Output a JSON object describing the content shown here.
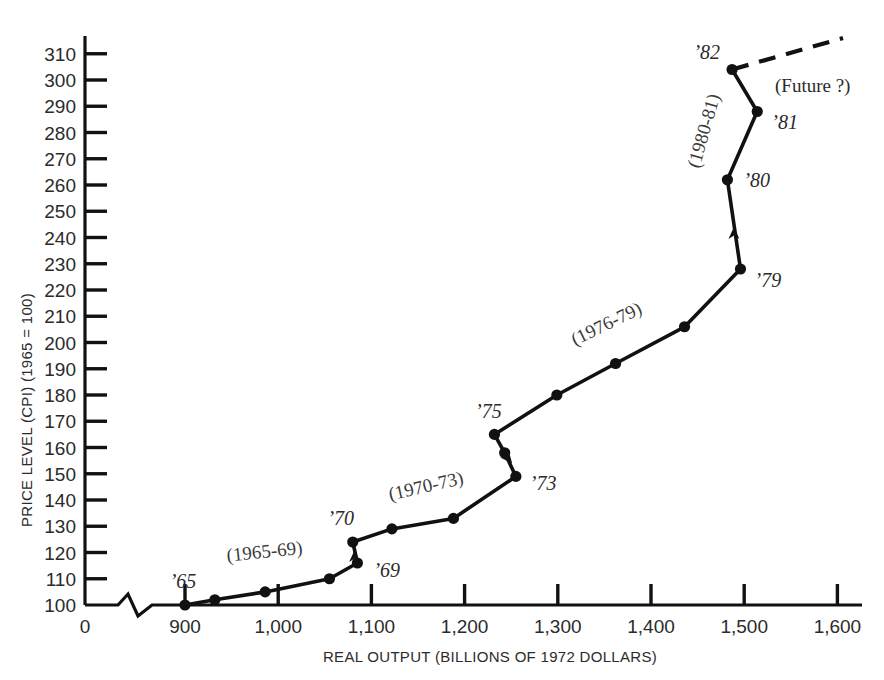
{
  "chart_data": {
    "type": "line",
    "title": "",
    "xlabel": "REAL OUTPUT (BILLIONS OF 1972 DOLLARS)",
    "ylabel": "PRICE LEVEL (CPI) (1965 = 100)",
    "xlim": [
      860,
      1620
    ],
    "ylim": [
      100,
      315
    ],
    "grid": false,
    "legend_position": "none",
    "axis_break_x": true,
    "x_zero_label": "0",
    "xticks": [
      900,
      1000,
      1100,
      1200,
      1300,
      1400,
      1500,
      1600
    ],
    "xtick_labels": [
      "900",
      "1,000",
      "1,100",
      "1,200",
      "1,300",
      "1,400",
      "1,500",
      "1,600"
    ],
    "yticks": [
      100,
      110,
      120,
      130,
      140,
      150,
      160,
      170,
      180,
      190,
      200,
      210,
      220,
      230,
      240,
      250,
      260,
      270,
      280,
      290,
      300,
      310
    ],
    "ytick_labels": [
      "100",
      "110",
      "120",
      "130",
      "140",
      "150",
      "160",
      "170",
      "180",
      "190",
      "200",
      "210",
      "220",
      "230",
      "240",
      "250",
      "260",
      "270",
      "280",
      "290",
      "300",
      "310"
    ],
    "series": [
      {
        "name": "US economy path 1965-1982",
        "points": [
          {
            "year": "1965",
            "x": 900,
            "y": 100,
            "label": "’65"
          },
          {
            "year": "1966",
            "x": 932,
            "y": 102,
            "label": ""
          },
          {
            "year": "1967",
            "x": 986,
            "y": 105,
            "label": ""
          },
          {
            "year": "1968",
            "x": 1055,
            "y": 110,
            "label": ""
          },
          {
            "year": "1969",
            "x": 1085,
            "y": 116,
            "label": "’69"
          },
          {
            "year": "1970",
            "x": 1080,
            "y": 124,
            "label": "’70"
          },
          {
            "year": "1971",
            "x": 1122,
            "y": 129,
            "label": ""
          },
          {
            "year": "1972",
            "x": 1188,
            "y": 133,
            "label": ""
          },
          {
            "year": "1973",
            "x": 1255,
            "y": 149,
            "label": "’73"
          },
          {
            "year": "1974",
            "x": 1243,
            "y": 158,
            "label": ""
          },
          {
            "year": "1975",
            "x": 1232,
            "y": 165,
            "label": "’75"
          },
          {
            "year": "1976",
            "x": 1299,
            "y": 180,
            "label": ""
          },
          {
            "year": "1977",
            "x": 1362,
            "y": 192,
            "label": ""
          },
          {
            "year": "1978",
            "x": 1436,
            "y": 206,
            "label": ""
          },
          {
            "year": "1979",
            "x": 1496,
            "y": 228,
            "label": "’79"
          },
          {
            "year": "1980",
            "x": 1482,
            "y": 262,
            "label": "’80"
          },
          {
            "year": "1981",
            "x": 1514,
            "y": 288,
            "label": "’81"
          },
          {
            "year": "1982",
            "x": 1487,
            "y": 304,
            "label": "’82"
          }
        ]
      }
    ],
    "future_line": {
      "label": "(Future ?)",
      "style": "dashed",
      "from": {
        "x": 1487,
        "y": 304
      },
      "to": {
        "x": 1606,
        "y": 316
      }
    },
    "segment_annotations": [
      {
        "text": "(1965-69)",
        "x": 986,
        "y": 118,
        "rotation": -6
      },
      {
        "text": "(1970-73)",
        "x": 1160,
        "y": 143,
        "rotation": -13
      },
      {
        "text": "(1976-79)",
        "x": 1355,
        "y": 205,
        "rotation": -26
      },
      {
        "text": "(1980-81)",
        "x": 1463,
        "y": 280,
        "rotation": -74
      }
    ],
    "arrows": [
      {
        "at_x": 1082,
        "at_y": 121,
        "direction": "up"
      },
      {
        "at_x": 1251,
        "at_y": 154,
        "direction": "down-right"
      },
      {
        "at_x": 1489,
        "at_y": 244,
        "direction": "up"
      }
    ]
  }
}
